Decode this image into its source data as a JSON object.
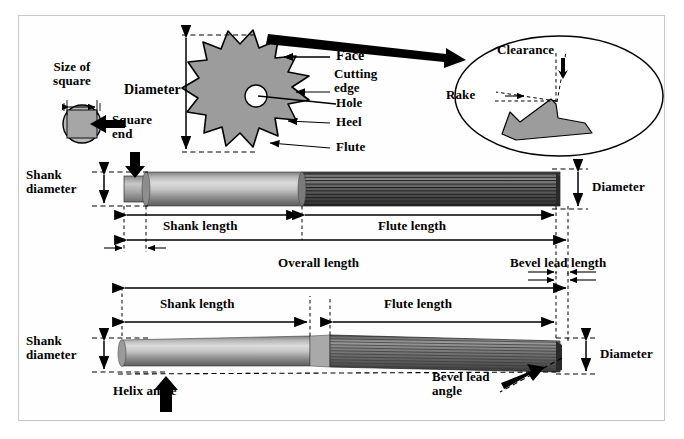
{
  "figure": {
    "domain": "engineering-technical-illustration",
    "frame_color": "#c9c9c9",
    "background": "#ffffff",
    "metal_light": "#d8d8d8",
    "metal_mid": "#9a9a9a",
    "metal_dark": "#4a4a4a",
    "fill_gray": "#9c9c9c",
    "line_color": "#000000"
  },
  "labels": {
    "size_of_square": "Size  of\nsquare",
    "square_end": "Square\nend",
    "diameter_top": "Diameter",
    "face": "Face",
    "cutting_edge": "Cutting\nedge",
    "hole": "Hole",
    "heel": "Heel",
    "flute": "Flute",
    "clearance": "Clearance",
    "rake": "Rake",
    "shank_diameter_mid": "Shank\ndiameter",
    "shank_length_mid": "Shank length",
    "flute_length_mid": "Flute length",
    "diameter_mid": "Diameter",
    "overall_length": "Overall length",
    "bevel_lead_length": "Bevel lead length",
    "shank_length_bot": "Shank length",
    "flute_length_bot": "Flute length",
    "shank_diameter_bot": "Shank\ndiameter",
    "diameter_bot": "Diameter",
    "helix_angle": "Helix angle",
    "bevel_lead_angle": "Bevel lead\nangle"
  },
  "views": {
    "top": {
      "name": "end-view-cross-section",
      "parts": [
        "square-end-circle",
        "cutter-star-cross-section",
        "rake-clearance-detail-ellipse"
      ]
    },
    "middle": {
      "name": "straight-flute-reamer-side-view",
      "dimensions": [
        "Shank length",
        "Flute length",
        "Overall length",
        "Bevel lead length",
        "Shank diameter",
        "Diameter"
      ]
    },
    "bottom": {
      "name": "helical-flute-reamer-side-view",
      "dimensions": [
        "Shank length",
        "Flute length",
        "Shank diameter",
        "Diameter"
      ],
      "angles": [
        "Helix angle",
        "Bevel lead angle"
      ]
    }
  }
}
